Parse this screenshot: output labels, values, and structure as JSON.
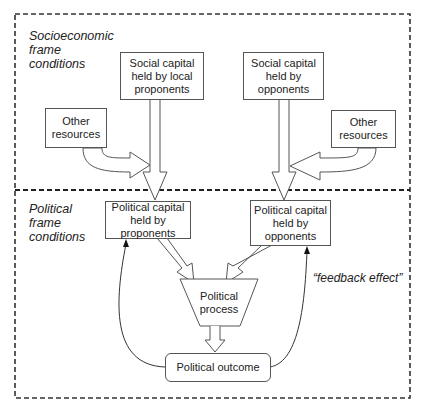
{
  "sections": {
    "socioeconomic": {
      "label": "Socioeconomic frame conditions",
      "lines": [
        "Socioeconomic",
        "frame",
        "conditions"
      ]
    },
    "political": {
      "label": "Political frame conditions",
      "lines": [
        "Political",
        "frame",
        "conditions"
      ]
    }
  },
  "nodes": {
    "social_capital_proponents": "Social capital held by local proponents",
    "social_capital_opponents": "Social capital held by opponents",
    "other_resources_left": "Other resources",
    "other_resources_right": "Other resources",
    "political_capital_proponents": "Political capital held by proponents",
    "political_capital_opponents": "Political capital held by opponents",
    "political_process": "Political process",
    "political_outcome": "Political outcome"
  },
  "node_lines": {
    "social_capital_proponents": [
      "Social capital",
      "held by local",
      "proponents"
    ],
    "social_capital_opponents": [
      "Social capital",
      "held by",
      "opponents"
    ],
    "other_resources_left": [
      "Other",
      "resources"
    ],
    "other_resources_right": [
      "Other",
      "resources"
    ],
    "political_capital_proponents": [
      "Political capital",
      "held by",
      "proponents"
    ],
    "political_capital_opponents": [
      "Political capital",
      "held by",
      "opponents"
    ],
    "political_process": [
      "Political",
      "process"
    ],
    "political_outcome": [
      "Political outcome"
    ]
  },
  "annotations": {
    "feedback": "“feedback effect”"
  },
  "edges": [
    {
      "from": "social_capital_proponents",
      "to": "political_capital_proponents",
      "style": "block-arrow"
    },
    {
      "from": "social_capital_opponents",
      "to": "political_capital_opponents",
      "style": "block-arrow"
    },
    {
      "from": "other_resources_left",
      "to": "social_capital_proponents_arrow",
      "style": "curved-block-arrow"
    },
    {
      "from": "other_resources_right",
      "to": "social_capital_opponents_arrow",
      "style": "curved-block-arrow"
    },
    {
      "from": "political_capital_proponents",
      "to": "political_process",
      "style": "block-arrow"
    },
    {
      "from": "political_capital_opponents",
      "to": "political_process",
      "style": "block-arrow"
    },
    {
      "from": "political_process",
      "to": "political_outcome",
      "style": "block-arrow"
    },
    {
      "from": "political_outcome",
      "to": "political_capital_proponents",
      "style": "curved-line-arrow",
      "label": "feedback effect"
    },
    {
      "from": "political_outcome",
      "to": "political_capital_opponents",
      "style": "curved-line-arrow",
      "label": "feedback effect"
    }
  ],
  "colors": {
    "stroke": "#555555",
    "text": "#222222",
    "background": "#ffffff",
    "dash": "#333333"
  }
}
